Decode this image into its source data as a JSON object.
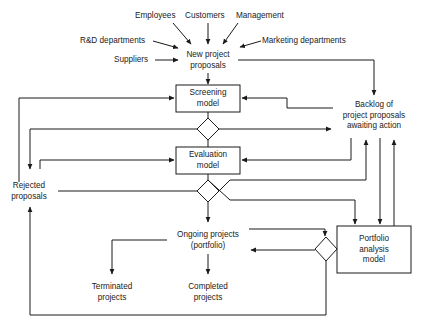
{
  "diagram": {
    "sources": {
      "employees": "Employees",
      "customers": "Customers",
      "management": "Management",
      "rd": "R&D departments",
      "marketing": "Marketing departments",
      "suppliers": "Suppliers"
    },
    "nodes": {
      "new_proposals": [
        "New project",
        "proposals"
      ],
      "screening": [
        "Screening",
        "model"
      ],
      "evaluation": [
        "Evaluation",
        "model"
      ],
      "backlog": [
        "Backlog of",
        "project proposals",
        "awaiting action"
      ],
      "rejected": [
        "Rejected",
        "proposals"
      ],
      "ongoing": [
        "Ongoing projects",
        "(portfolio)"
      ],
      "portfolio_model": [
        "Portfolio",
        "analysis",
        "model"
      ],
      "terminated": [
        "Terminated",
        "projects"
      ],
      "completed": [
        "Completed",
        "projects"
      ]
    },
    "decision_points": [
      "screening-decision",
      "evaluation-decision",
      "portfolio-decision"
    ],
    "colors": {
      "line": "#1a1a1a",
      "background": "#ffffff"
    }
  }
}
